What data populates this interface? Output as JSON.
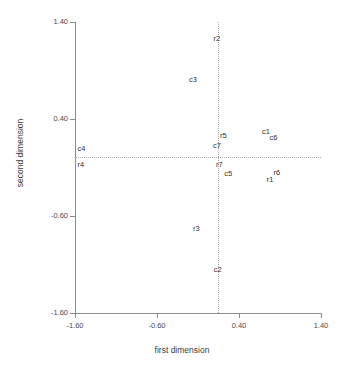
{
  "chart_data": {
    "type": "scatter",
    "title": "",
    "xlabel": "first dimension",
    "ylabel": "second dimension",
    "xlim": [
      -1.6,
      1.4
    ],
    "ylim": [
      -1.6,
      1.4
    ],
    "xticks": [
      "-1.60",
      "-0.60",
      "0.40",
      "1.40"
    ],
    "xtick_values": [
      -1.6,
      -0.6,
      0.4,
      1.4
    ],
    "yticks": [
      "1.40",
      "0.40",
      "-0.60",
      "-1.60"
    ],
    "ytick_values": [
      1.4,
      0.4,
      -0.6,
      -1.6
    ],
    "grid": false,
    "legend": "none",
    "reference_lines": {
      "vertical_x": 0.15,
      "horizontal_y": 0.01,
      "style": "dotted",
      "color": "#a8a8a8"
    },
    "marker_style": "text-label-only",
    "points": [
      {
        "label": "r2",
        "x": 0.13,
        "y": 1.22
      },
      {
        "label": "c3",
        "x": -0.16,
        "y": 0.8
      },
      {
        "label": "c1",
        "x": 0.73,
        "y": 0.27
      },
      {
        "label": "c6",
        "x": 0.82,
        "y": 0.2
      },
      {
        "label": "r5",
        "x": 0.21,
        "y": 0.22
      },
      {
        "label": "c7",
        "x": 0.13,
        "y": 0.12
      },
      {
        "label": "c4",
        "x": -1.52,
        "y": 0.09
      },
      {
        "label": "r4",
        "x": -1.53,
        "y": -0.07
      },
      {
        "label": "r7",
        "x": 0.16,
        "y": -0.07
      },
      {
        "label": "c5",
        "x": 0.27,
        "y": -0.17
      },
      {
        "label": "r6",
        "x": 0.86,
        "y": -0.16
      },
      {
        "label": "r1",
        "x": 0.78,
        "y": -0.23
      },
      {
        "label": "r3",
        "x": -0.12,
        "y": -0.73
      },
      {
        "label": "c2",
        "x": 0.14,
        "y": -1.16
      }
    ]
  }
}
